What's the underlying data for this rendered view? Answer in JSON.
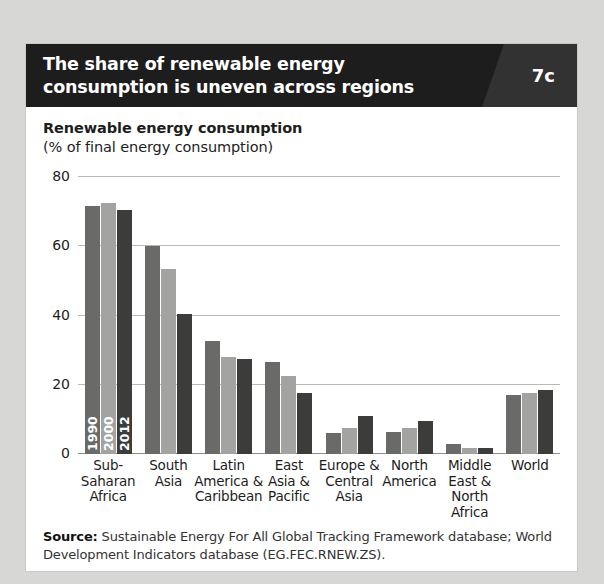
{
  "header": {
    "title_line1": "The share of renewable energy",
    "title_line2": "consumption is uneven across regions",
    "panel_number": "7c",
    "background_color": "#1d1d1d",
    "panel_number_background": "#323232"
  },
  "axis_title": {
    "main": "Renewable energy consumption",
    "sub": "(% of final energy consumption)"
  },
  "series_inline_labels": {
    "s1": "1990",
    "s2": "2000",
    "s3": "2012"
  },
  "source": {
    "label": "Source:",
    "text": " Sustainable Energy For All Global Tracking Framework database; World Development Indicators database (EG.FEC.RNEW.ZS)."
  },
  "chart_data": {
    "type": "bar",
    "title": "The share of renewable energy consumption is uneven across regions",
    "subtitle": "Renewable energy consumption (% of final energy consumption)",
    "xlabel": "",
    "ylabel": "Renewable energy consumption (% of final energy consumption)",
    "ylim": [
      0,
      80
    ],
    "yticks": [
      0,
      20,
      40,
      60,
      80
    ],
    "ytick_labels": [
      "0",
      "20",
      "40",
      "60",
      "80"
    ],
    "grid": "horizontal",
    "legend_position": "inline-first-group",
    "categories": [
      "Sub-Saharan Africa",
      "South Asia",
      "Latin America & Caribbean",
      "East Asia & Pacific",
      "Europe & Central Asia",
      "North America",
      "Middle East & North Africa",
      "World"
    ],
    "category_label_lines": [
      [
        "Sub-",
        "Saharan",
        "Africa"
      ],
      [
        "South",
        "Asia"
      ],
      [
        "Latin",
        "America &",
        "Caribbean"
      ],
      [
        "East",
        "Asia &",
        "Pacific"
      ],
      [
        "Europe &",
        "Central",
        "Asia"
      ],
      [
        "North",
        "America"
      ],
      [
        "Middle",
        "East &",
        "North",
        "Africa"
      ],
      [
        "World"
      ]
    ],
    "series": [
      {
        "name": "1990",
        "color": "#6a6b69",
        "values": [
          71.5,
          60.0,
          32.5,
          26.5,
          6.0,
          6.5,
          3.0,
          17.0
        ]
      },
      {
        "name": "2000",
        "color": "#a3a4a2",
        "values": [
          72.5,
          53.5,
          28.0,
          22.5,
          7.5,
          7.5,
          1.8,
          17.5
        ]
      },
      {
        "name": "2012",
        "color": "#3c3d3b",
        "values": [
          70.5,
          40.5,
          27.5,
          17.5,
          11.0,
          9.5,
          1.8,
          18.5
        ]
      }
    ]
  }
}
